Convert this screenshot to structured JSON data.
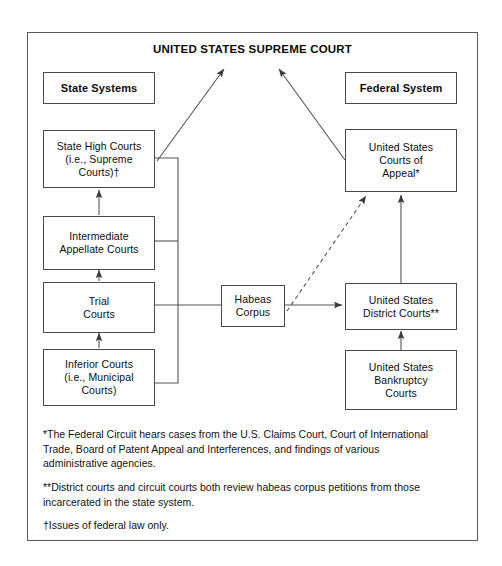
{
  "diagram": {
    "type": "flowchart",
    "title": "UNITED STATES SUPREME COURT",
    "colors": {
      "background": "#ffffff",
      "frame_border": "#5a5a5a",
      "box_border": "#4a4a4a",
      "text": "#0e0e0e",
      "connector": "#555555"
    },
    "headers": {
      "left": "State Systems",
      "right": "Federal System"
    },
    "nodes": {
      "state_high_courts": "State High Courts\n(i.e., Supreme\nCourts)†",
      "intermediate_appellate_courts": "Intermediate\nAppellate Courts",
      "trial_courts": "Trial\nCourts",
      "inferior_courts": "Inferior Courts\n(i.e., Municipal\nCourts)",
      "habeas_corpus": "Habeas\nCorpus",
      "us_courts_of_appeal": "United States\nCourts of\nAppeal*",
      "us_district_courts": "United States\nDistrict Courts**",
      "us_bankruptcy_courts": "United States\nBankruptcy\nCourts"
    },
    "footnotes": [
      "*The Federal Circuit hears cases from the U.S. Claims Court, Court of International Trade, Board of Patent Appeal and Interferences, and findings of various administrative agencies.",
      "**District courts and circuit courts both review habeas corpus petitions from those incarcerated in the state system.",
      "†Issues of federal law only."
    ]
  }
}
